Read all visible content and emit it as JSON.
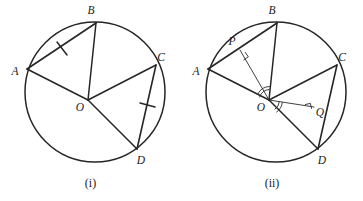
{
  "figure": {
    "background_color": "#ffffff",
    "stroke_color": "#262626",
    "thin_stroke_color": "#2b2b2b",
    "panels": [
      {
        "id": "panel-i",
        "caption": "(i)",
        "circle": {
          "cx": 95,
          "cy": 92,
          "r": 70
        },
        "center_label": "O",
        "points": [
          {
            "name": "A",
            "label": "A",
            "x": 27,
            "y": 69,
            "label_x": 15,
            "label_y": 72
          },
          {
            "name": "B",
            "label": "B",
            "x": 96,
            "y": 23,
            "label_x": 91,
            "label_y": 11
          },
          {
            "name": "C",
            "label": "C",
            "x": 156,
            "y": 65,
            "label_x": 161,
            "label_y": 58
          },
          {
            "name": "D",
            "label": "D",
            "x": 137,
            "y": 149,
            "label_x": 141,
            "label_y": 161
          },
          {
            "name": "O",
            "label": "O",
            "x": 88,
            "y": 100,
            "label_x": 80,
            "label_y": 108
          }
        ],
        "chords": [
          {
            "name": "chord-AB",
            "from": "A",
            "to": "B",
            "tick": true
          },
          {
            "name": "chord-CD",
            "from": "C",
            "to": "D",
            "tick": true
          }
        ],
        "radii": [
          {
            "name": "radius-OA",
            "to": "A"
          },
          {
            "name": "radius-OB",
            "to": "B"
          },
          {
            "name": "radius-OC",
            "to": "C"
          },
          {
            "name": "radius-OD",
            "to": "D"
          }
        ],
        "has_perpendiculars": false,
        "has_angle_arcs": false
      },
      {
        "id": "panel-ii",
        "caption": "(ii)",
        "circle": {
          "cx": 276,
          "cy": 92,
          "r": 70
        },
        "center_label": "O",
        "points": [
          {
            "name": "A",
            "label": "A",
            "x": 208,
            "y": 69,
            "label_x": 196,
            "label_y": 72
          },
          {
            "name": "B",
            "label": "B",
            "x": 277,
            "y": 23,
            "label_x": 272,
            "label_y": 11
          },
          {
            "name": "C",
            "label": "C",
            "x": 337,
            "y": 65,
            "label_x": 342,
            "label_y": 58
          },
          {
            "name": "D",
            "label": "D",
            "x": 318,
            "y": 149,
            "label_x": 322,
            "label_y": 161
          },
          {
            "name": "O",
            "label": "O",
            "x": 269,
            "y": 100,
            "label_x": 261,
            "label_y": 108
          },
          {
            "name": "P",
            "label": "P",
            "x": 240,
            "y": 50,
            "label_x": 232,
            "label_y": 42
          },
          {
            "name": "Q",
            "label": "Q",
            "x": 314,
            "y": 107,
            "label_x": 320,
            "label_y": 113
          }
        ],
        "chords": [
          {
            "name": "chord-AB",
            "from": "A",
            "to": "B",
            "tick": false
          },
          {
            "name": "chord-CD",
            "from": "C",
            "to": "D",
            "tick": false
          }
        ],
        "radii": [
          {
            "name": "radius-OA",
            "to": "A"
          },
          {
            "name": "radius-OB",
            "to": "B"
          },
          {
            "name": "radius-OC",
            "to": "C"
          },
          {
            "name": "radius-OD",
            "to": "D"
          }
        ],
        "perpendiculars": [
          {
            "name": "perpendicular-OP",
            "from": "O",
            "to": "P",
            "foot_on": "chord-AB",
            "right_angle": true
          },
          {
            "name": "perpendicular-OQ",
            "from": "O",
            "to": "Q",
            "foot_on": "chord-CD",
            "right_angle": true
          }
        ],
        "angle_arcs": [
          {
            "name": "angle-AOB",
            "vertex": "O",
            "between": "A and B"
          },
          {
            "name": "angle-COD",
            "vertex": "O",
            "between": "C and D"
          }
        ],
        "has_perpendiculars": true,
        "has_angle_arcs": true
      }
    ]
  }
}
